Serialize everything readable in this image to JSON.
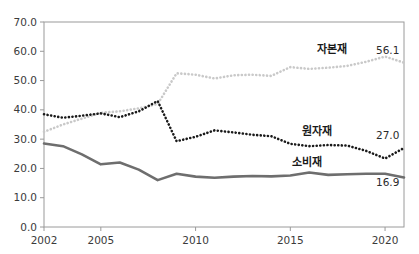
{
  "chart_data": {
    "type": "line",
    "title": "",
    "xlabel": "",
    "ylabel": "",
    "xlim": [
      2002,
      2021
    ],
    "ylim": [
      0.0,
      70.0
    ],
    "grid": false,
    "legend_position": "inline-annotation",
    "x": [
      2002,
      2003,
      2004,
      2005,
      2006,
      2007,
      2008,
      2009,
      2010,
      2011,
      2012,
      2013,
      2014,
      2015,
      2016,
      2017,
      2018,
      2019,
      2020,
      2021
    ],
    "y_ticks": [
      "0.0",
      "10.0",
      "20.0",
      "30.0",
      "40.0",
      "50.0",
      "60.0",
      "70.0"
    ],
    "y_tick_values": [
      0.0,
      10.0,
      20.0,
      30.0,
      40.0,
      50.0,
      60.0,
      70.0
    ],
    "x_ticks": [
      "2002",
      "2005",
      "2010",
      "2015",
      "2020"
    ],
    "x_tick_values": [
      2002,
      2005,
      2010,
      2015,
      2020
    ],
    "series": [
      {
        "name": "자본재",
        "style": "dotted",
        "color": "#c9c9c9",
        "label_x": 2017.2,
        "label_y": 59.5,
        "end_label": "56.1",
        "end_value": 56.1,
        "values": [
          32.5,
          35.0,
          37.0,
          39.0,
          39.5,
          40.5,
          42.0,
          52.5,
          52.0,
          50.7,
          51.8,
          52.0,
          51.6,
          54.6,
          54.0,
          54.4,
          55.0,
          56.4,
          58.2,
          56.1
        ]
      },
      {
        "name": "원자재",
        "style": "dotted",
        "color": "#1a1a1a",
        "label_x": 2016.4,
        "label_y": 31.4,
        "end_label": "27.0",
        "end_value": 27.0,
        "values": [
          38.5,
          37.3,
          38.0,
          38.8,
          37.5,
          39.5,
          43.0,
          29.3,
          30.8,
          33.0,
          32.3,
          31.5,
          31.0,
          28.4,
          27.6,
          28.0,
          27.8,
          26.0,
          23.4,
          27.0
        ]
      },
      {
        "name": "소비재",
        "style": "solid",
        "color": "#6e6e6e",
        "label_x": 2015.9,
        "label_y": 21.0,
        "end_label": "16.9",
        "end_value": 16.9,
        "values": [
          28.5,
          27.6,
          24.8,
          21.4,
          22.0,
          19.6,
          16.0,
          18.2,
          17.2,
          16.8,
          17.2,
          17.4,
          17.3,
          17.6,
          18.6,
          17.8,
          18.0,
          18.2,
          18.2,
          16.9
        ]
      }
    ]
  },
  "axis": {
    "axis_color": "#9a9a9a",
    "tick_color": "#9a9a9a"
  }
}
